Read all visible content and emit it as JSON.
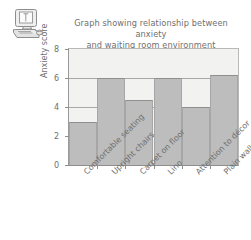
{
  "icon": {
    "name": "computer-workstation-icon",
    "alt": "desktop computer with monitor, keyboard and mouse"
  },
  "chart_data": {
    "type": "bar",
    "title": "Graph showing relationship between anxiety and waiting room environment",
    "title_line1": "Graph showing relationship between anxiety",
    "title_line2": "and waiting room environment",
    "xlabel": "",
    "ylabel": "Anxiety score",
    "ylim": [
      0,
      8
    ],
    "yticks": [
      0,
      2,
      4,
      6,
      8
    ],
    "ytick_labels": [
      "0",
      "2",
      "4",
      "6",
      "8"
    ],
    "grid": false,
    "legend": "none",
    "categories": [
      "Comfortable seating",
      "Upright chairs",
      "Carpet on floor",
      "Lino",
      "Attention to décor",
      "Plain walls"
    ],
    "values": [
      3.0,
      6.0,
      4.5,
      6.0,
      4.0,
      6.2
    ],
    "bar_color": "#bdbdbd",
    "plot_background": "#f2f2f0",
    "axis_color": "#8e8e8e"
  }
}
